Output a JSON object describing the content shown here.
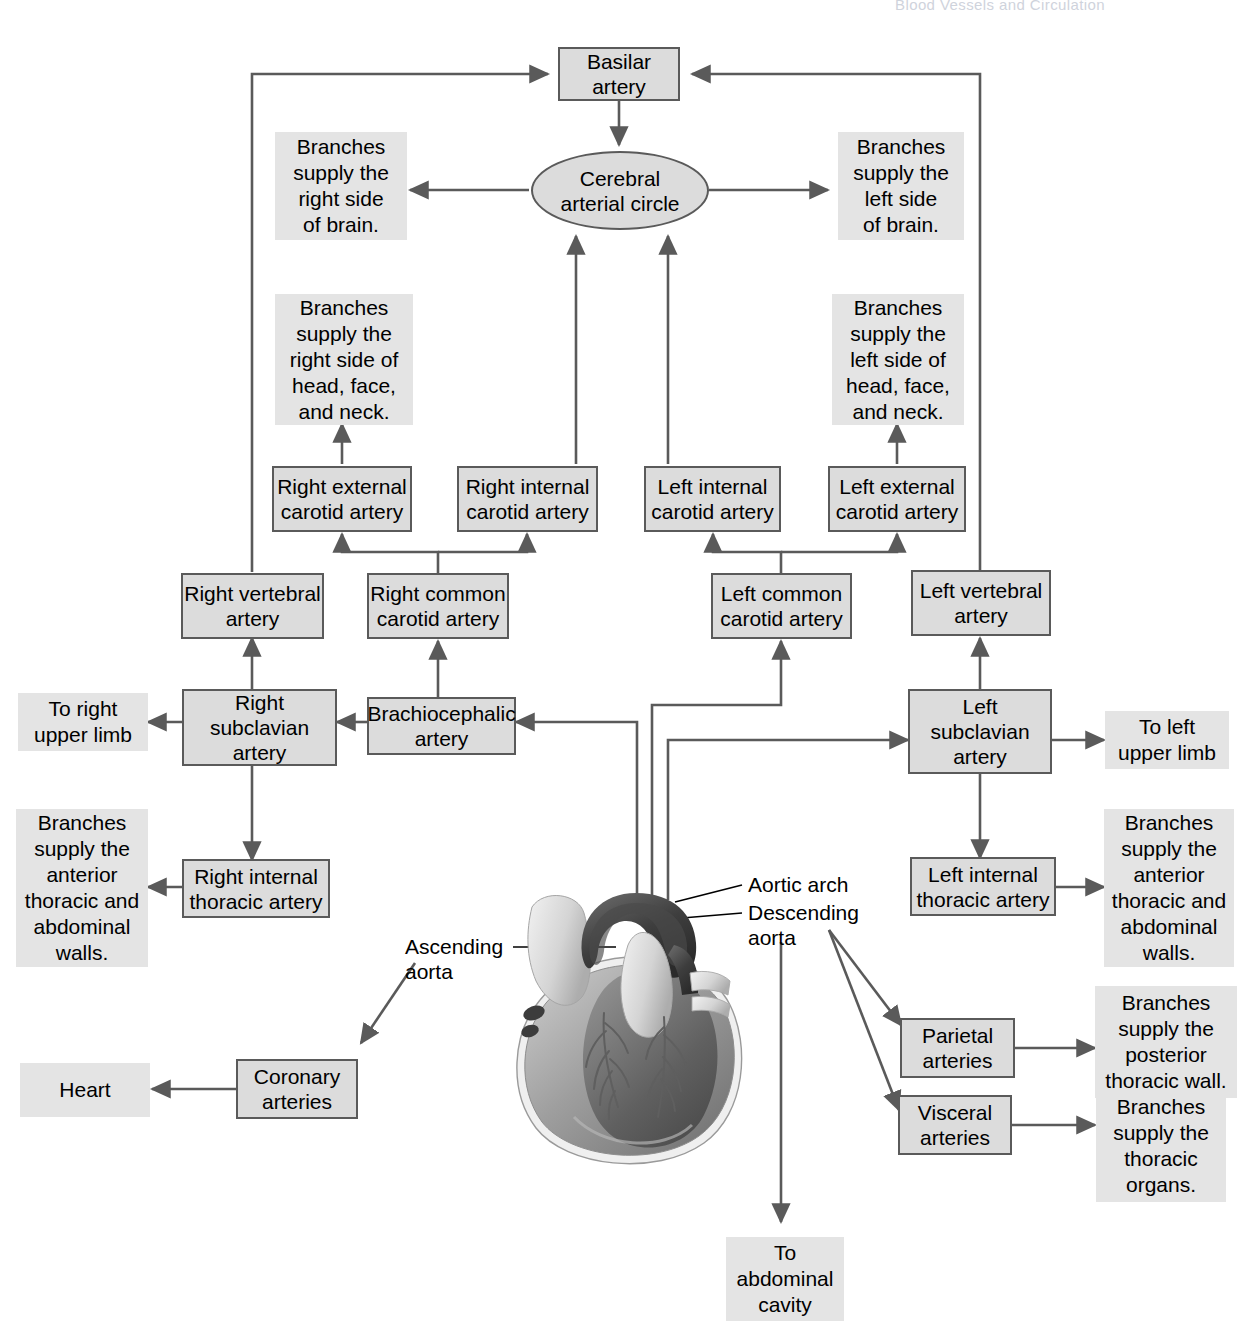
{
  "header": {
    "running_head": "Blood Vessels and Circulation"
  },
  "nodes": {
    "basilar_artery": "Basilar\nartery",
    "cerebral_arterial_circle": "Cerebral\narterial circle",
    "right_external_carotid": "Right external\ncarotid artery",
    "right_internal_carotid": "Right internal\ncarotid artery",
    "left_internal_carotid": "Left internal\ncarotid artery",
    "left_external_carotid": "Left external\ncarotid artery",
    "right_vertebral": "Right vertebral\nartery",
    "right_common_carotid": "Right common\ncarotid artery",
    "left_common_carotid": "Left common\ncarotid artery",
    "left_vertebral": "Left vertebral\nartery",
    "right_subclavian": "Right\nsubclavian\nartery",
    "brachiocephalic": "Brachiocephalic\nartery",
    "left_subclavian": "Left\nsubclavian\nartery",
    "right_internal_thoracic": "Right internal\nthoracic artery",
    "left_internal_thoracic": "Left internal\nthoracic artery",
    "coronary_arteries": "Coronary\narteries",
    "parietal_arteries": "Parietal\narteries",
    "visceral_arteries": "Visceral\narteries"
  },
  "annotations": {
    "right_brain": "Branches\nsupply the\nright side\nof brain.",
    "left_brain": "Branches\nsupply the\nleft side\nof brain.",
    "right_head": "Branches\nsupply the\nright side of\nhead, face,\nand neck.",
    "left_head": "Branches\nsupply the\nleft side of\nhead, face,\nand neck.",
    "to_right_upper_limb": "To right\nupper limb",
    "to_left_upper_limb": "To left\nupper limb",
    "right_thoracic_abdominal": "Branches\nsupply the\nanterior\nthoracic and\nabdominal\nwalls.",
    "left_thoracic_abdominal": "Branches\nsupply the\nanterior\nthoracic and\nabdominal\nwalls.",
    "heart": "Heart",
    "posterior_thoracic_wall": "Branches\nsupply the\nposterior\nthoracic wall.",
    "thoracic_organs": "Branches\nsupply the\nthoracic\norgans.",
    "to_abdominal_cavity": "To\nabdominal\ncavity"
  },
  "callouts": {
    "aortic_arch": "Aortic arch",
    "descending_aorta": "Descending\naorta",
    "ascending_aorta": "Ascending\naorta"
  },
  "artwork": {
    "label": "heart-illustration"
  },
  "colors": {
    "node_fill": "#dcdcdc",
    "node_border": "#5a5a5a",
    "annotation_fill": "#e4e4e4",
    "connector": "#5a5a5a",
    "text": "#000000",
    "page_background": "#ffffff"
  }
}
